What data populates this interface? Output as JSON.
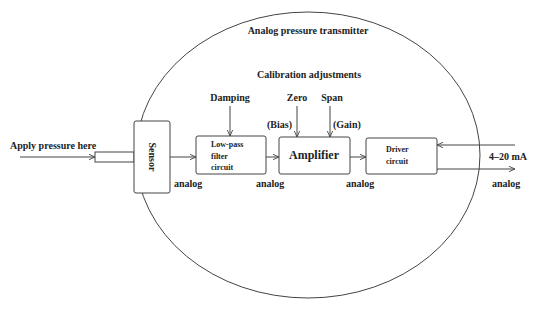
{
  "diagram": {
    "title": "Analog pressure transmitter",
    "calibration_heading": "Calibration adjustments",
    "input_label": "Apply pressure here",
    "blocks": {
      "sensor": "Sensor",
      "lowpass": [
        "Low-pass",
        "filter",
        "circuit"
      ],
      "amplifier": "Amplifier",
      "driver": [
        "Driver",
        "circuit"
      ]
    },
    "adjustments": {
      "damping": "Damping",
      "zero": "Zero",
      "zero_sub": "(Bias)",
      "span": "Span",
      "span_sub": "(Gain)"
    },
    "signal_labels": {
      "after_sensor": "analog",
      "after_filter": "analog",
      "after_amplifier": "analog",
      "output": "analog"
    },
    "loop_label": "4–20 mA"
  }
}
